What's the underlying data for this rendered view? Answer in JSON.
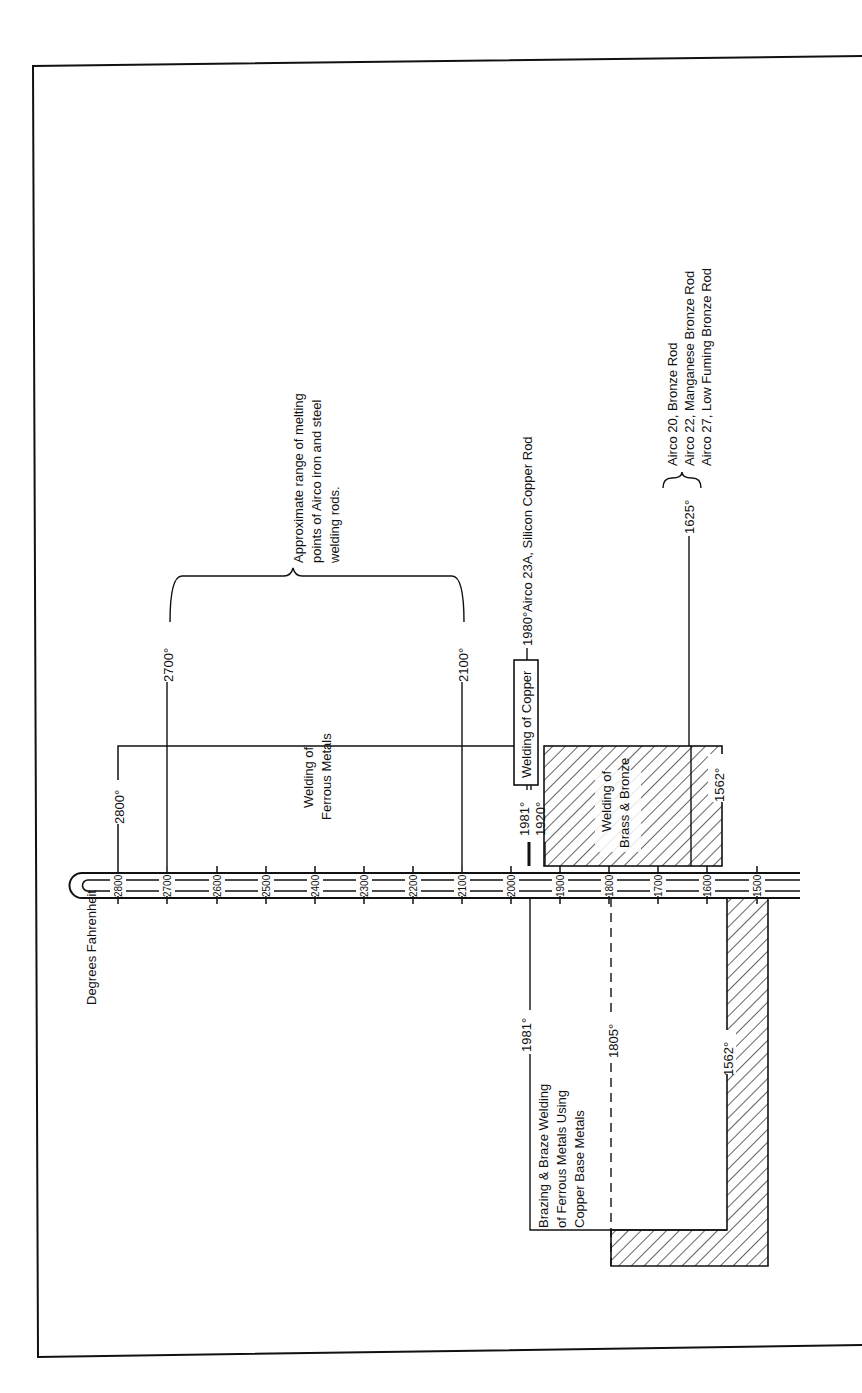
{
  "diagram": {
    "title": "Degrees Fahrenheit",
    "orientation": "rotated 90deg counter-clockwise",
    "colors": {
      "ink": "#111111",
      "paper": "#ffffff"
    },
    "thermometer": {
      "ticks": [
        "2800",
        "2700",
        "2600",
        "2500",
        "2400",
        "2300",
        "2200",
        "2100",
        "2000",
        "1900",
        "1800",
        "1700",
        "1600",
        "1500"
      ]
    },
    "regions": {
      "ferrous": {
        "label_line1": "Welding of",
        "label_line2": "Ferrous Metals",
        "temp_label": "2800°"
      },
      "copper": {
        "label": "Welding of Copper",
        "temp_left": "1981°",
        "temp_right": "1980°",
        "rod_note": "Airco 23A, Silicon Copper Rod"
      },
      "brass_bronze": {
        "label_line1": "Welding of",
        "label_line2": "Brass & Bronze",
        "temp_top": "1920°",
        "temp_bottom": "1562°"
      },
      "brazing": {
        "label_line1": "Brazing & Braze Welding",
        "label_line2": "of Ferrous Metals Using",
        "label_line3": "Copper Base Metals",
        "temp_top": "1981°",
        "temp_dashed": "1805°",
        "temp_bottom": "1562°"
      }
    },
    "iron_steel_rods": {
      "temp_high": "2700°",
      "temp_low": "2100°",
      "note_line1": "Approximate range of melting",
      "note_line2": "points of Airco iron and steel",
      "note_line3": "welding rods."
    },
    "bronze_rods": {
      "temp": "1625°",
      "items": [
        "Airco 20, Bronze Rod",
        "Airco 22, Manganese Bronze Rod",
        "Airco 27, Low Fuming Bronze Rod"
      ]
    }
  }
}
